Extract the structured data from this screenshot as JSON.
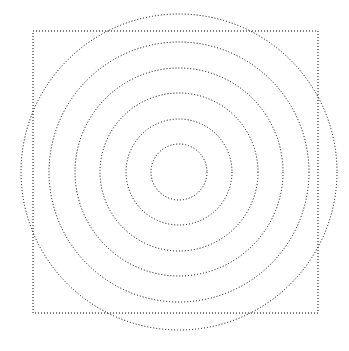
{
  "figure": {
    "width": 349,
    "height": 351,
    "background_color": "#ffffff",
    "stroke_color": "#000000",
    "stroke_width": 1,
    "line_style": "dotted",
    "dash_pattern": "1 2"
  },
  "chart_data": {
    "type": "scatter",
    "subtitle": "",
    "xlabel": "",
    "ylabel": "",
    "grid": false,
    "legend_position": "none",
    "axis_visible": false,
    "tick_labels_visible": false,
    "xlim": [
      0,
      349
    ],
    "ylim": [
      0,
      351
    ],
    "center": {
      "x": 179,
      "y": 172
    },
    "annotations": [],
    "series": [
      {
        "name": "circle-1-innermost",
        "shape": "circle",
        "cx": 179,
        "cy": 172,
        "r": 28,
        "stroke": "#000000",
        "dash": "1 2"
      },
      {
        "name": "circle-2",
        "shape": "circle",
        "cx": 179,
        "cy": 172,
        "r": 53,
        "stroke": "#000000",
        "dash": "1 2"
      },
      {
        "name": "circle-3",
        "shape": "circle",
        "cx": 179,
        "cy": 172,
        "r": 79,
        "stroke": "#000000",
        "dash": "1 2"
      },
      {
        "name": "circle-4",
        "shape": "circle",
        "cx": 179,
        "cy": 172,
        "r": 104,
        "stroke": "#000000",
        "dash": "1 2"
      },
      {
        "name": "circle-5",
        "shape": "circle",
        "cx": 179,
        "cy": 172,
        "r": 130,
        "stroke": "#000000",
        "dash": "1 2"
      },
      {
        "name": "circle-6-outermost",
        "shape": "circle",
        "cx": 179,
        "cy": 172,
        "r": 158,
        "stroke": "#000000",
        "dash": "1 2"
      },
      {
        "name": "square-outline",
        "shape": "rect",
        "x": 33,
        "y": 31,
        "width": 285,
        "height": 282,
        "stroke": "#000000",
        "dash": "1 2"
      }
    ],
    "counts": {
      "circles": 6,
      "rectangles": 1,
      "total_shapes": 7
    },
    "radii": [
      28,
      53,
      79,
      104,
      130,
      158
    ],
    "radial_spacing": [
      25,
      26,
      25,
      26,
      28
    ]
  }
}
